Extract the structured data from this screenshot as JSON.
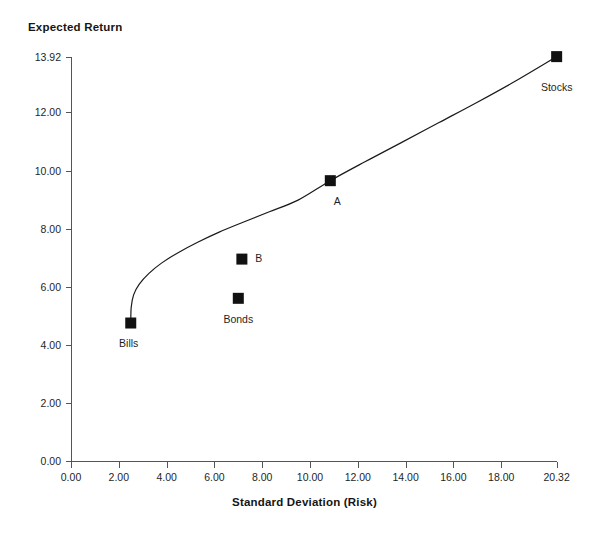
{
  "chart_data": {
    "type": "scatter",
    "title": "",
    "xlabel": "Standard Deviation (Risk)",
    "ylabel": "Expected Return",
    "grid": false,
    "legend": "none",
    "xlim": [
      0.0,
      20.32
    ],
    "ylim": [
      0.0,
      13.92
    ],
    "xticks": [
      "0.00",
      "2.00",
      "4.00",
      "6.00",
      "8.00",
      "10.00",
      "12.00",
      "14.00",
      "16.00",
      "18.00",
      "20.32"
    ],
    "xtick_values": [
      0.0,
      2.0,
      4.0,
      6.0,
      8.0,
      10.0,
      12.0,
      14.0,
      16.0,
      18.0,
      20.32
    ],
    "yticks": [
      "0.00",
      "2.00",
      "4.00",
      "6.00",
      "8.00",
      "10.00",
      "12.00",
      "13.92"
    ],
    "ytick_values": [
      0.0,
      2.0,
      4.0,
      6.0,
      8.0,
      10.0,
      12.0,
      13.92
    ],
    "points": [
      {
        "label": "Bills",
        "x": 2.5,
        "y": 4.75,
        "label_dx": -2,
        "label_dy": 20
      },
      {
        "label": "Bonds",
        "x": 7.0,
        "y": 5.6,
        "label_dx": 0,
        "label_dy": 21
      },
      {
        "label": "B",
        "x": 7.15,
        "y": 6.95,
        "label_dx": 17,
        "label_dy": -1
      },
      {
        "label": "A",
        "x": 10.85,
        "y": 9.65,
        "label_dx": 7,
        "label_dy": 20
      },
      {
        "label": "Stocks",
        "x": 20.32,
        "y": 13.92,
        "label_dx": 0,
        "label_dy": 30
      }
    ],
    "curve": {
      "name": "efficient-frontier",
      "points": [
        [
          2.5,
          4.75
        ],
        [
          2.52,
          5.3
        ],
        [
          2.62,
          5.72
        ],
        [
          2.85,
          6.08
        ],
        [
          3.25,
          6.45
        ],
        [
          3.8,
          6.82
        ],
        [
          4.5,
          7.18
        ],
        [
          5.3,
          7.53
        ],
        [
          6.2,
          7.88
        ],
        [
          7.2,
          8.22
        ],
        [
          8.3,
          8.58
        ],
        [
          9.5,
          8.98
        ],
        [
          10.85,
          9.65
        ],
        [
          12.3,
          10.3
        ],
        [
          13.8,
          10.95
        ],
        [
          15.4,
          11.65
        ],
        [
          17.0,
          12.35
        ],
        [
          18.6,
          13.08
        ],
        [
          20.32,
          13.92
        ]
      ]
    },
    "colors": {
      "marker": "#111111",
      "curve": "#1a1a1a",
      "axis": "#555555",
      "text": "#1a1a1a",
      "background": "#ffffff"
    }
  },
  "geometry": {
    "x0_px": 71,
    "y0_px": 461,
    "x_px_per_unit": 23.9,
    "y_px_per_unit": 29.05,
    "marker_size_px": 11
  }
}
